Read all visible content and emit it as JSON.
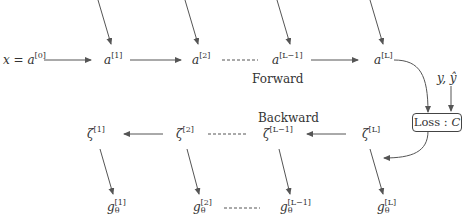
{
  "diagram": {
    "forward": {
      "label": "Forward",
      "nodes": [
        {
          "id": "a0",
          "prefix": "x = a",
          "sup": "[0]"
        },
        {
          "id": "a1",
          "base": "a",
          "sup": "[1]"
        },
        {
          "id": "a2",
          "base": "a",
          "sup": "[2]"
        },
        {
          "id": "aLm1",
          "base": "a",
          "sup": "[L−1]"
        },
        {
          "id": "aL",
          "base": "a",
          "sup": "[L]"
        }
      ]
    },
    "targets": {
      "label": "y, ŷ"
    },
    "loss": {
      "label": "Loss : ",
      "var": "C"
    },
    "backward": {
      "label": "Backward",
      "nodes": [
        {
          "id": "z1",
          "base": "ζ",
          "sup": "[1]"
        },
        {
          "id": "z2",
          "base": "ζ",
          "sup": "[2]"
        },
        {
          "id": "zLm1",
          "base": "ζ",
          "sup": "[L−1]"
        },
        {
          "id": "zL",
          "base": "ζ",
          "sup": "[L]"
        }
      ]
    },
    "gradients": {
      "nodes": [
        {
          "id": "g1",
          "base": "g",
          "sub": "θ",
          "sup": "[1]"
        },
        {
          "id": "g2",
          "base": "g",
          "sub": "θ",
          "sup": "[2]"
        },
        {
          "id": "gLm1",
          "base": "g",
          "sub": "θ",
          "sup": "[L−1]"
        },
        {
          "id": "gL",
          "base": "g",
          "sub": "θ",
          "sup": "[L]"
        }
      ]
    },
    "edges": [
      {
        "from": "a0",
        "to": "a1"
      },
      {
        "from": "a1",
        "to": "a2"
      },
      {
        "from": "a2",
        "to": "aLm1",
        "style": "dashed"
      },
      {
        "from": "aLm1",
        "to": "aL"
      },
      {
        "from": "aL",
        "to": "loss",
        "style": "curved"
      },
      {
        "from": "targets",
        "to": "loss"
      },
      {
        "from": "loss",
        "to": "zL",
        "style": "curved"
      },
      {
        "from": "zL",
        "to": "zLm1"
      },
      {
        "from": "zLm1",
        "to": "z2",
        "style": "dashed"
      },
      {
        "from": "z2",
        "to": "z1"
      },
      {
        "from": "z1",
        "to": "g1"
      },
      {
        "from": "z2",
        "to": "g2"
      },
      {
        "from": "zLm1",
        "to": "gLm1"
      },
      {
        "from": "zL",
        "to": "gL"
      },
      {
        "from": "g2",
        "to": "gLm1",
        "style": "dashed"
      }
    ],
    "colors": {
      "stroke": "#555555",
      "text": "#333333"
    }
  }
}
